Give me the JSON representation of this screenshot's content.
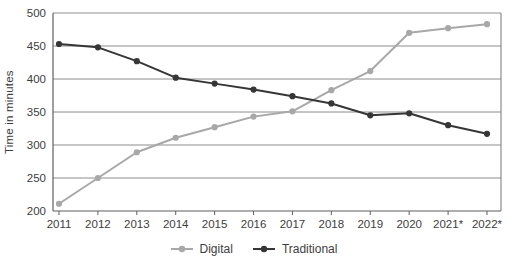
{
  "chart_data": {
    "type": "line",
    "title": "",
    "xlabel": "",
    "ylabel": "Time in minutes",
    "categories": [
      "2011",
      "2012",
      "2013",
      "2014",
      "2015",
      "2016",
      "2017",
      "2018",
      "2019",
      "2020",
      "2021*",
      "2022*"
    ],
    "series": [
      {
        "name": "Digital",
        "color": "#a8a8a8",
        "values": [
          211,
          250,
          289,
          311,
          327,
          343,
          351,
          383,
          412,
          470,
          477,
          483
        ]
      },
      {
        "name": "Traditional",
        "color": "#363636",
        "values": [
          453,
          448,
          427,
          402,
          393,
          384,
          374,
          363,
          345,
          348,
          330,
          317
        ]
      }
    ],
    "ylim": [
      200,
      500
    ],
    "ytick_step": 50,
    "yticks": [
      "200",
      "250",
      "300",
      "350",
      "400",
      "450",
      "500"
    ],
    "grid": true,
    "legend_position": "bottom",
    "colors": {
      "gridline": "#8c8c8c",
      "axis": "#5f5f5f",
      "tick_text": "#3d3d3d",
      "background": "#ffffff"
    }
  }
}
